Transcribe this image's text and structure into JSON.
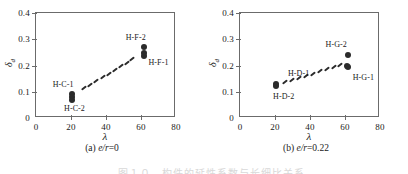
{
  "figure": {
    "panels": [
      {
        "id": "a",
        "caption_prefix": "(a) ",
        "caption_var": "e/r",
        "caption_value": "=0"
      },
      {
        "id": "b",
        "caption_prefix": "(b) ",
        "caption_var": "e/r",
        "caption_value": "=0.22"
      }
    ],
    "bottom_caption_sliver": "图１０　构件的延性系数与长细比关系"
  },
  "chart_data": [
    {
      "type": "scatter",
      "panel": "a",
      "title": "(a) e/r=0",
      "xlabel": "λ",
      "ylabel": "δd",
      "ylabel_base": "δ",
      "ylabel_sub": "d",
      "xlim": [
        0,
        80
      ],
      "ylim": [
        0,
        0.4
      ],
      "xticks": [
        0,
        20,
        40,
        60,
        80
      ],
      "xticklabels": [
        "0",
        "20",
        "40",
        "60",
        "80"
      ],
      "yticks": [
        0,
        0.1,
        0.2,
        0.3,
        0.4
      ],
      "yticklabels": [
        "0",
        "0.1",
        "0.2",
        "0.3",
        "0.4"
      ],
      "grid": false,
      "legend": "none",
      "series": [
        {
          "name": "specimens",
          "marker": "filled-circle",
          "points": [
            {
              "x": 20.5,
              "y": 0.093
            },
            {
              "x": 20.5,
              "y": 0.079
            },
            {
              "x": 20.8,
              "y": 0.07
            },
            {
              "x": 61.5,
              "y": 0.272
            },
            {
              "x": 61.5,
              "y": 0.247
            },
            {
              "x": 61.5,
              "y": 0.236
            }
          ]
        },
        {
          "name": "trend-dashes",
          "marker": "dash",
          "points": [
            {
              "x": 27.5,
              "y": 0.114
            },
            {
              "x": 31.0,
              "y": 0.127
            },
            {
              "x": 34.5,
              "y": 0.14
            },
            {
              "x": 38.0,
              "y": 0.155
            },
            {
              "x": 41.5,
              "y": 0.168
            },
            {
              "x": 45.0,
              "y": 0.182
            },
            {
              "x": 48.5,
              "y": 0.196
            },
            {
              "x": 52.0,
              "y": 0.21
            },
            {
              "x": 55.0,
              "y": 0.224
            }
          ]
        }
      ],
      "annotations": [
        {
          "text": "H-C-1",
          "x": 15.5,
          "y": 0.128
        },
        {
          "text": "H-C-2",
          "x": 22.0,
          "y": 0.04
        },
        {
          "text": "H-F-2",
          "x": 57.0,
          "y": 0.308
        },
        {
          "text": "H-F-1",
          "x": 70.0,
          "y": 0.212
        }
      ]
    },
    {
      "type": "scatter",
      "panel": "b",
      "title": "(b) e/r=0.22",
      "xlabel": "λ",
      "ylabel": "δd",
      "ylabel_base": "δ",
      "ylabel_sub": "d",
      "xlim": [
        0,
        80
      ],
      "ylim": [
        0,
        0.4
      ],
      "xticks": [
        0,
        20,
        40,
        60,
        80
      ],
      "xticklabels": [
        "0",
        "20",
        "40",
        "60",
        "80"
      ],
      "yticks": [
        0,
        0.1,
        0.2,
        0.3,
        0.4
      ],
      "yticklabels": [
        "0",
        "0.1",
        "0.2",
        "0.3",
        "0.4"
      ],
      "grid": false,
      "legend": "none",
      "series": [
        {
          "name": "specimens",
          "marker": "filled-circle",
          "points": [
            {
              "x": 20.5,
              "y": 0.128
            },
            {
              "x": 20.8,
              "y": 0.122
            },
            {
              "x": 61.5,
              "y": 0.239
            },
            {
              "x": 61.0,
              "y": 0.198
            },
            {
              "x": 61.8,
              "y": 0.193
            }
          ]
        },
        {
          "name": "trend-dashes",
          "marker": "dash",
          "points": [
            {
              "x": 25.5,
              "y": 0.136
            },
            {
              "x": 29.5,
              "y": 0.145
            },
            {
              "x": 33.5,
              "y": 0.153
            },
            {
              "x": 37.5,
              "y": 0.161
            },
            {
              "x": 41.5,
              "y": 0.169
            },
            {
              "x": 45.5,
              "y": 0.178
            },
            {
              "x": 49.5,
              "y": 0.186
            },
            {
              "x": 53.5,
              "y": 0.194
            },
            {
              "x": 57.0,
              "y": 0.2
            }
          ]
        }
      ],
      "annotations": [
        {
          "text": "H-D-1",
          "x": 33.5,
          "y": 0.172
        },
        {
          "text": "H-D-2",
          "x": 25.0,
          "y": 0.085
        },
        {
          "text": "H-G-2",
          "x": 55.0,
          "y": 0.283
        },
        {
          "text": "H-G-1",
          "x": 70.5,
          "y": 0.157
        }
      ]
    }
  ]
}
